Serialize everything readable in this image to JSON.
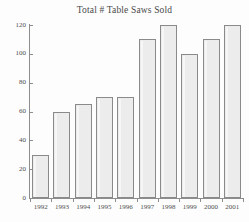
{
  "chart_data": {
    "type": "bar",
    "title": "Total # Table Saws Sold",
    "xlabel": "",
    "ylabel": "",
    "categories": [
      "1992",
      "1993",
      "1994",
      "1995",
      "1996",
      "1997",
      "1998",
      "1999",
      "2000",
      "2001"
    ],
    "values": [
      30,
      60,
      65,
      70,
      70,
      110,
      120,
      100,
      110,
      120
    ],
    "ylim": [
      0,
      120
    ],
    "yticks": [
      0,
      20,
      40,
      60,
      80,
      100,
      120
    ],
    "ytick_labels": [
      "0",
      "20",
      "40",
      "60",
      "80",
      "100",
      "120"
    ],
    "grid": false,
    "legend": false,
    "legend_position": "none",
    "bar_fill_color": "#ececec",
    "bar_border_color": "#8a8a8a",
    "axis_color": "#8d8d8d",
    "text_color": "#4a4a4a",
    "background_color": "#fdfdfd"
  }
}
